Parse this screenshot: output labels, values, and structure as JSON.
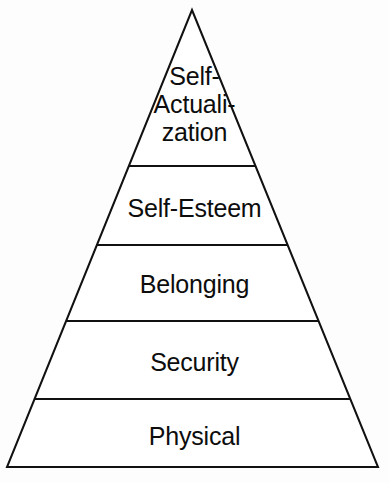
{
  "diagram": {
    "type": "pyramid",
    "title": "",
    "shape": {
      "apex": {
        "x": 192,
        "y": 10
      },
      "base_left": {
        "x": 7,
        "y": 467
      },
      "base_right": {
        "x": 378,
        "y": 467
      },
      "divider_y": [
        166,
        245,
        321,
        399
      ],
      "stroke_color": "#111111",
      "fill_color": "#ffffff",
      "stroke_width": 2
    },
    "tiers": [
      {
        "id": "self-actualization",
        "label": "Self-\nActuali-\nzation",
        "label_plain": "Self-Actualization",
        "level": 5,
        "top_y": 10,
        "bottom_y": 166
      },
      {
        "id": "self-esteem",
        "label": "Self-Esteem",
        "label_plain": "Self-Esteem",
        "level": 4,
        "top_y": 166,
        "bottom_y": 245
      },
      {
        "id": "belonging",
        "label": "Belonging",
        "label_plain": "Belonging",
        "level": 3,
        "top_y": 245,
        "bottom_y": 321
      },
      {
        "id": "security",
        "label": "Security",
        "label_plain": "Security",
        "level": 2,
        "top_y": 321,
        "bottom_y": 399
      },
      {
        "id": "physical",
        "label": "Physical",
        "label_plain": "Physical",
        "level": 1,
        "top_y": 399,
        "bottom_y": 467
      }
    ]
  }
}
